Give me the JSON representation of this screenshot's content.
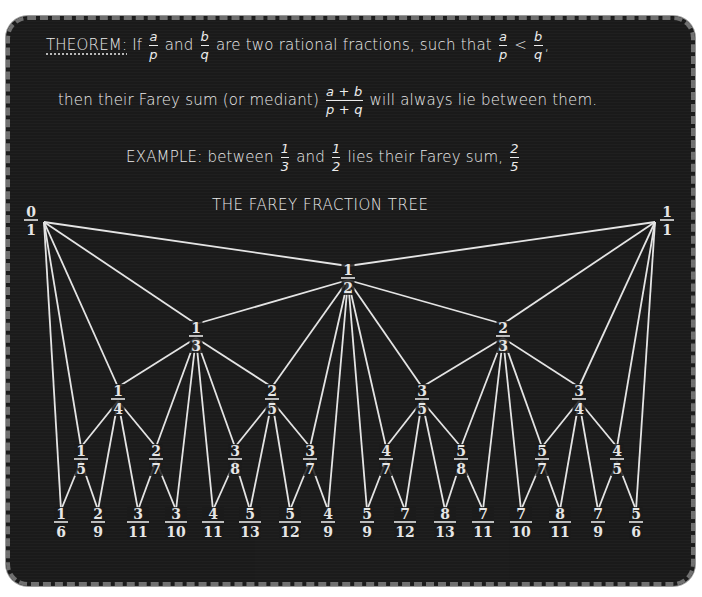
{
  "theorem": {
    "label": "THEOREM:",
    "line1_a": "If",
    "frac1": {
      "num": "a",
      "den": "p"
    },
    "line1_b": "and",
    "frac2": {
      "num": "b",
      "den": "q"
    },
    "line1_c": "are two rational fractions, such that",
    "frac3": {
      "num": "a",
      "den": "p"
    },
    "lt": "<",
    "frac4": {
      "num": "b",
      "den": "q"
    },
    "line1_end": ",",
    "line2_a": "then their Farey sum (or mediant)",
    "frac5": {
      "num": "a + b",
      "den": "p + q"
    },
    "line2_b": "will always lie between them."
  },
  "example": {
    "label": "EXAMPLE:",
    "text_a": "between",
    "frac1": {
      "num": "1",
      "den": "3"
    },
    "text_b": "and",
    "frac2": {
      "num": "1",
      "den": "2"
    },
    "text_c": "lies their Farey sum,",
    "frac3": {
      "num": "2",
      "den": "5"
    }
  },
  "tree": {
    "title": "THE FAREY FRACTION TREE",
    "nodes": [
      {
        "id": "0/1",
        "num": "0",
        "den": "1",
        "level": 0
      },
      {
        "id": "1/1",
        "num": "1",
        "den": "1",
        "level": 0
      },
      {
        "id": "1/2",
        "num": "1",
        "den": "2",
        "level": 1
      },
      {
        "id": "1/3",
        "num": "1",
        "den": "3",
        "level": 2
      },
      {
        "id": "2/3",
        "num": "2",
        "den": "3",
        "level": 2
      },
      {
        "id": "1/4",
        "num": "1",
        "den": "4",
        "level": 3
      },
      {
        "id": "2/5",
        "num": "2",
        "den": "5",
        "level": 3
      },
      {
        "id": "3/5",
        "num": "3",
        "den": "5",
        "level": 3
      },
      {
        "id": "3/4",
        "num": "3",
        "den": "4",
        "level": 3
      },
      {
        "id": "1/5",
        "num": "1",
        "den": "5",
        "level": 4
      },
      {
        "id": "2/7",
        "num": "2",
        "den": "7",
        "level": 4
      },
      {
        "id": "3/8",
        "num": "3",
        "den": "8",
        "level": 4
      },
      {
        "id": "3/7",
        "num": "3",
        "den": "7",
        "level": 4
      },
      {
        "id": "4/7",
        "num": "4",
        "den": "7",
        "level": 4
      },
      {
        "id": "5/8",
        "num": "5",
        "den": "8",
        "level": 4
      },
      {
        "id": "5/7",
        "num": "5",
        "den": "7",
        "level": 4
      },
      {
        "id": "4/5",
        "num": "4",
        "den": "5",
        "level": 4
      },
      {
        "id": "1/6",
        "num": "1",
        "den": "6",
        "level": 5
      },
      {
        "id": "2/9",
        "num": "2",
        "den": "9",
        "level": 5
      },
      {
        "id": "3/11",
        "num": "3",
        "den": "11",
        "level": 5
      },
      {
        "id": "3/10",
        "num": "3",
        "den": "10",
        "level": 5
      },
      {
        "id": "4/11",
        "num": "4",
        "den": "11",
        "level": 5
      },
      {
        "id": "5/13",
        "num": "5",
        "den": "13",
        "level": 5
      },
      {
        "id": "5/12",
        "num": "5",
        "den": "12",
        "level": 5
      },
      {
        "id": "4/9",
        "num": "4",
        "den": "9",
        "level": 5
      },
      {
        "id": "5/9",
        "num": "5",
        "den": "9",
        "level": 5
      },
      {
        "id": "7/12",
        "num": "7",
        "den": "12",
        "level": 5
      },
      {
        "id": "8/13",
        "num": "8",
        "den": "13",
        "level": 5
      },
      {
        "id": "7/11",
        "num": "7",
        "den": "11",
        "level": 5
      },
      {
        "id": "7/10",
        "num": "7",
        "den": "10",
        "level": 5
      },
      {
        "id": "8/11",
        "num": "8",
        "den": "11",
        "level": 5
      },
      {
        "id": "7/9",
        "num": "7",
        "den": "9",
        "level": 5
      },
      {
        "id": "5/6",
        "num": "5",
        "den": "6",
        "level": 5
      }
    ],
    "edges": [
      [
        "0/1",
        "1/2"
      ],
      [
        "1/1",
        "1/2"
      ],
      [
        "0/1",
        "1/3"
      ],
      [
        "1/2",
        "1/3"
      ],
      [
        "1/2",
        "2/3"
      ],
      [
        "1/1",
        "2/3"
      ],
      [
        "0/1",
        "1/4"
      ],
      [
        "1/3",
        "1/4"
      ],
      [
        "1/3",
        "2/5"
      ],
      [
        "1/2",
        "2/5"
      ],
      [
        "1/2",
        "3/5"
      ],
      [
        "2/3",
        "3/5"
      ],
      [
        "2/3",
        "3/4"
      ],
      [
        "1/1",
        "3/4"
      ],
      [
        "0/1",
        "1/5"
      ],
      [
        "1/4",
        "1/5"
      ],
      [
        "1/4",
        "2/7"
      ],
      [
        "1/3",
        "2/7"
      ],
      [
        "1/3",
        "3/8"
      ],
      [
        "2/5",
        "3/8"
      ],
      [
        "2/5",
        "3/7"
      ],
      [
        "1/2",
        "3/7"
      ],
      [
        "1/2",
        "4/7"
      ],
      [
        "3/5",
        "4/7"
      ],
      [
        "3/5",
        "5/8"
      ],
      [
        "2/3",
        "5/8"
      ],
      [
        "2/3",
        "5/7"
      ],
      [
        "3/4",
        "5/7"
      ],
      [
        "3/4",
        "4/5"
      ],
      [
        "1/1",
        "4/5"
      ],
      [
        "0/1",
        "1/6"
      ],
      [
        "1/5",
        "1/6"
      ],
      [
        "1/5",
        "2/9"
      ],
      [
        "1/4",
        "2/9"
      ],
      [
        "1/4",
        "3/11"
      ],
      [
        "2/7",
        "3/11"
      ],
      [
        "2/7",
        "3/10"
      ],
      [
        "1/3",
        "3/10"
      ],
      [
        "1/3",
        "4/11"
      ],
      [
        "3/8",
        "4/11"
      ],
      [
        "3/8",
        "5/13"
      ],
      [
        "2/5",
        "5/13"
      ],
      [
        "2/5",
        "5/12"
      ],
      [
        "3/7",
        "5/12"
      ],
      [
        "3/7",
        "4/9"
      ],
      [
        "1/2",
        "4/9"
      ],
      [
        "1/2",
        "5/9"
      ],
      [
        "4/7",
        "5/9"
      ],
      [
        "4/7",
        "7/12"
      ],
      [
        "3/5",
        "7/12"
      ],
      [
        "3/5",
        "8/13"
      ],
      [
        "5/8",
        "8/13"
      ],
      [
        "5/8",
        "7/11"
      ],
      [
        "2/3",
        "7/11"
      ],
      [
        "2/3",
        "7/10"
      ],
      [
        "5/7",
        "7/10"
      ],
      [
        "5/7",
        "8/11"
      ],
      [
        "3/4",
        "8/11"
      ],
      [
        "3/4",
        "7/9"
      ],
      [
        "4/5",
        "7/9"
      ],
      [
        "4/5",
        "5/6"
      ],
      [
        "1/1",
        "5/6"
      ]
    ]
  }
}
